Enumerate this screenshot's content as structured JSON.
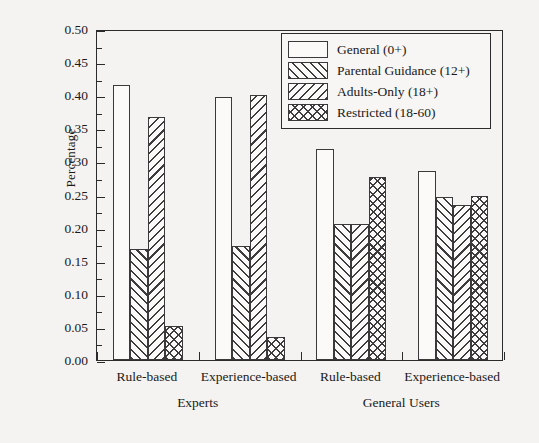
{
  "chart_data": {
    "type": "bar",
    "title": "",
    "xlabel": "",
    "ylabel": "Percentage",
    "ylim": [
      0.0,
      0.5
    ],
    "ytick_step": 0.05,
    "yticks": [
      "0.00",
      "0.05",
      "0.10",
      "0.15",
      "0.20",
      "0.25",
      "0.30",
      "0.35",
      "0.40",
      "0.45",
      "0.50"
    ],
    "minor_ticks": true,
    "grid": false,
    "legend_position": "top-right",
    "categories": [
      "Rule-based",
      "Experience-based",
      "Rule-based",
      "Experience-based"
    ],
    "group_labels": [
      "Experts",
      "General Users"
    ],
    "group_spans": [
      2,
      2
    ],
    "series": [
      {
        "name": "General (0+)",
        "pattern": "none",
        "values": [
          0.415,
          0.397,
          0.318,
          0.285
        ]
      },
      {
        "name": "Parental Guidance (12+)",
        "pattern": "fwd",
        "values": [
          0.168,
          0.172,
          0.206,
          0.246
        ]
      },
      {
        "name": "Adults-Only (18+)",
        "pattern": "back",
        "values": [
          0.367,
          0.4,
          0.206,
          0.234
        ]
      },
      {
        "name": "Restricted (18-60)",
        "pattern": "cross",
        "values": [
          0.051,
          0.035,
          0.277,
          0.248
        ]
      }
    ]
  },
  "legend": {
    "items": [
      {
        "label": "General (0+)",
        "pattern": "none"
      },
      {
        "label": "Parental Guidance (12+)",
        "pattern": "fwd"
      },
      {
        "label": "Adults-Only (18+)",
        "pattern": "back"
      },
      {
        "label": "Restricted (18-60)",
        "pattern": "cross"
      }
    ]
  },
  "axis": {
    "y_title": "Percentage"
  },
  "colors": {
    "background": "#f4f3f1",
    "axis": "#2b2b2b",
    "bar_edge": "#3a3a3a",
    "bar_fill": "#fbfaf8",
    "hatch": "#3d3d3d"
  }
}
